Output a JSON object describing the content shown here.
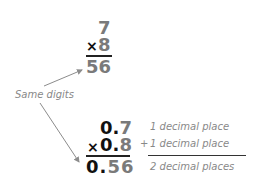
{
  "top_problem": {
    "factor1": "7",
    "times_sign": "×",
    "factor2": "8",
    "product": "56"
  },
  "annotation": {
    "label": "Same digits"
  },
  "bottom_problem": {
    "factor1_whole": "0.",
    "factor1_digit": "7",
    "times_sign": "×",
    "factor2_whole": "0.",
    "factor2_digit": "8",
    "product_whole": "0.",
    "product_digits": "56",
    "plus_sign": "+",
    "note1": "1 decimal place",
    "note2": "1 decimal place",
    "note3": "2 decimal places"
  },
  "colors": {
    "digit_grey": "#7a7a7a",
    "digit_black": "#111111",
    "label_grey": "#888888",
    "arrow_grey": "#8c8c8c"
  }
}
